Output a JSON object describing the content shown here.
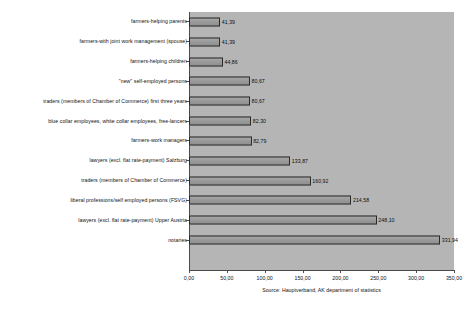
{
  "chart_data": {
    "type": "bar",
    "orientation": "horizontal",
    "title": "",
    "subtitle": "",
    "xlabel": "",
    "ylabel": "",
    "xlim": [
      0,
      350
    ],
    "grid": false,
    "legend": null,
    "decimal_separator": ",",
    "categories": [
      "farmers-helping parents",
      "farmers-with joint work management (spouse)",
      "farmers-helping children",
      "\"new\" self-employed persons",
      "traders (members of Chamber of Commerce) first three years",
      "blue collar employees, white collar employees, free-lancers",
      "farmers-work managers",
      "lawyers (excl. flat rate-payment) Salzburg",
      "traders (members of Chamber of Commerce)",
      "liberal professions/self employed persons (FSVG)",
      "lawyers (excl. flat rate-payment) Upper Austria",
      "notaries"
    ],
    "values": [
      41.39,
      41.39,
      44.86,
      80.67,
      80.67,
      82.3,
      82.79,
      133.87,
      160.92,
      214.58,
      248.1,
      331.94
    ],
    "value_labels": [
      "41,39",
      "41,39",
      "44,86",
      "80,67",
      "80,67",
      "82,30",
      "82,79",
      "133,87",
      "160,92",
      "214,58",
      "248,10",
      "331,94"
    ],
    "x_ticks": [
      0,
      50,
      100,
      150,
      200,
      250,
      300,
      350
    ],
    "x_tick_labels": [
      "0,00",
      "50,00",
      "100,00",
      "150,00",
      "200,00",
      "250,00",
      "300,00",
      "350,00"
    ],
    "source_note": "Source: Hauptverband, AK department of statistics",
    "colors": {
      "plot_background": "#b5b5b5",
      "bar_fill": "#9a9a9a",
      "bar_border": "#2a2a2a",
      "axis": "#4a4a4a",
      "text": "#111111",
      "page_background": "#ffffff"
    }
  }
}
